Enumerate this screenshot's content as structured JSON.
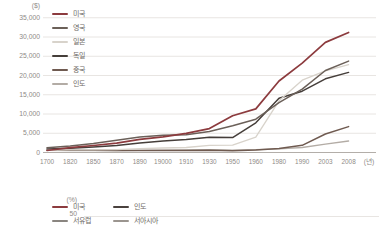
{
  "page": {
    "background": "#ffffff"
  },
  "chart_data": [
    {
      "type": "line",
      "title": "",
      "y_unit_label": "($)",
      "x_unit_label": "(년)",
      "categories": [
        "1700",
        "1820",
        "1850",
        "1870",
        "1890",
        "19000",
        "1910",
        "1930",
        "1950",
        "1960",
        "1980",
        "1990",
        "2003",
        "2008"
      ],
      "ylim": [
        0,
        35000
      ],
      "ytick_labels": [
        "35,000",
        "30,000",
        "25,000",
        "20,000",
        "15,000",
        "10,000",
        "5,000",
        "0"
      ],
      "grid": "horizontal",
      "legend_position": "top-left-inside",
      "series": [
        {
          "name": "미국",
          "color": "#8c3b3e",
          "values": [
            530,
            1260,
            1810,
            2450,
            3390,
            4090,
            4960,
            6210,
            9560,
            11330,
            18580,
            23200,
            28600,
            31180
          ]
        },
        {
          "name": "영국",
          "color": "#6b6059",
          "values": [
            1250,
            1710,
            2330,
            3190,
            4010,
            4490,
            4610,
            5440,
            6940,
            8650,
            12930,
            16430,
            21310,
            23740
          ]
        },
        {
          "name": "일본",
          "color": "#d8d3cb",
          "values": [
            570,
            670,
            680,
            740,
            1010,
            1180,
            1300,
            1850,
            1920,
            3990,
            13430,
            18790,
            21220,
            22820
          ]
        },
        {
          "name": "독일",
          "color": "#453e3a",
          "values": [
            910,
            1080,
            1430,
            1840,
            2430,
            2990,
            3350,
            3970,
            3880,
            7710,
            14110,
            15930,
            19140,
            20800
          ]
        },
        {
          "name": "중국",
          "color": "#6f5a50",
          "values": [
            600,
            600,
            600,
            530,
            540,
            550,
            550,
            570,
            450,
            660,
            1060,
            1870,
            4800,
            6730
          ]
        },
        {
          "name": "인도",
          "color": "#b3aca5",
          "values": [
            550,
            530,
            530,
            530,
            580,
            600,
            700,
            730,
            620,
            750,
            940,
            1310,
            2160,
            2980
          ]
        }
      ]
    },
    {
      "type": "line",
      "y_unit_label": "(%)",
      "visible_ytick_label": "50",
      "grid": "horizontal",
      "legend": [
        {
          "name": "미국",
          "color": "#8c3b3e"
        },
        {
          "name": "인도",
          "color": "#4a423e"
        },
        {
          "name": "서유럽",
          "color": "#8a8580"
        },
        {
          "name": "서아시아",
          "color": "#9b958f"
        }
      ]
    }
  ]
}
